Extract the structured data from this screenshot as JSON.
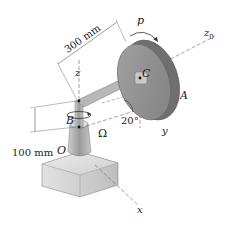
{
  "figure": {
    "type": "mechanics diagram"
  },
  "labels": {
    "p": "p",
    "z0": "z",
    "z0_sub": "0",
    "C": "C",
    "A": "A",
    "z": "z",
    "B": "B",
    "angle": "20°",
    "y": "y",
    "Omega": "Ω",
    "O": "O",
    "x": "x"
  },
  "dimensions": {
    "arm_length": "300 mm",
    "height": "100 mm"
  },
  "colors": {
    "disk_face": "#8a8a8a",
    "disk_rim": "#6f6f6f",
    "shaft": "#b5b5b5",
    "base": "#d4d4d4",
    "lines": "#555555"
  }
}
